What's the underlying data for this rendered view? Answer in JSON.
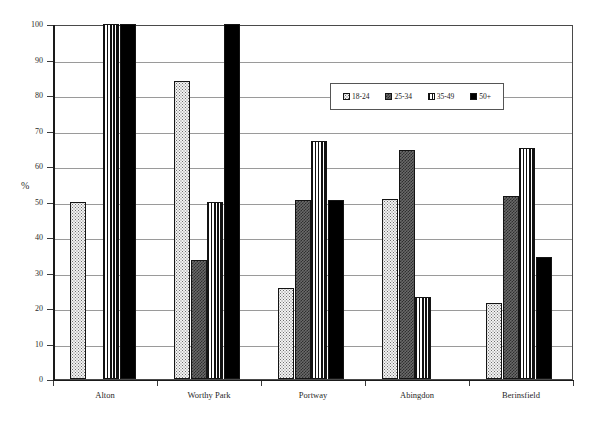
{
  "chart_data": {
    "type": "bar",
    "title": "",
    "subtitle": "",
    "xlabel": "",
    "ylabel": "%",
    "ylim": [
      0,
      100
    ],
    "yticks": [
      0,
      10,
      20,
      30,
      40,
      50,
      60,
      70,
      80,
      90,
      100
    ],
    "ytick_labels": [
      "0",
      "10",
      "20",
      "30",
      "40",
      "50",
      "60",
      "70",
      "80",
      "90",
      "100"
    ],
    "grid": true,
    "legend_position": "upper-center-right",
    "categories": [
      "Alton",
      "Worthy Park",
      "Portway",
      "Abingdon",
      "Berinsfield"
    ],
    "series": [
      {
        "name": "18-24",
        "pattern": "dots",
        "color": "#f2f2f2",
        "values": [
          50,
          84,
          25.5,
          50.8,
          21.5
        ]
      },
      {
        "name": "25-34",
        "pattern": "checker",
        "color": "#6a6a6a",
        "values": [
          0,
          33.5,
          50.5,
          64.5,
          51.5
        ]
      },
      {
        "name": "35-49",
        "pattern": "vertical-lines",
        "color": "#ffffff",
        "values": [
          100,
          50,
          67,
          23,
          65
        ]
      },
      {
        "name": "50+",
        "pattern": "solid",
        "color": "#000000",
        "values": [
          100,
          100,
          50.5,
          0,
          34.5
        ]
      }
    ]
  },
  "legend": {
    "entries": [
      {
        "label": "18-24"
      },
      {
        "label": "25-34"
      },
      {
        "label": "35-49"
      },
      {
        "label": "50+"
      }
    ]
  },
  "axes": {
    "y_axis_title": "%",
    "y_tick_labels": [
      "100",
      "90",
      "80",
      "70",
      "60",
      "50",
      "40",
      "30",
      "20",
      "10",
      "0"
    ],
    "x_tick_labels": [
      "Alton",
      "Worthy Park",
      "Portway",
      "Abingdon",
      "Berinsfield"
    ]
  },
  "colors": {
    "frame": "#4a4a4a",
    "axis": "#1a1a1a",
    "gridline": "#9a9a9a",
    "text": "#1f1f1f",
    "series_50plus": "#000000"
  }
}
